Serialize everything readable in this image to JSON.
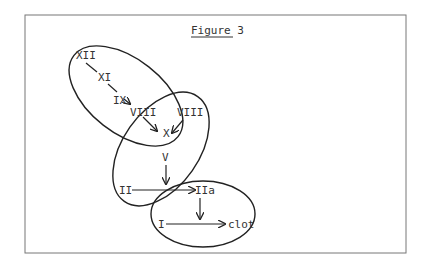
{
  "figure": {
    "title": "Figure 3",
    "nodes": {
      "xii": "XII",
      "xi": "XI",
      "ix": "IX",
      "viii_a": "VIII",
      "viii_b": "VIII",
      "x": "X",
      "v": "V",
      "ii": "II",
      "iia": "IIa",
      "i": "I",
      "clot": "clot"
    },
    "edges": [
      {
        "from": "XII",
        "to": "XI"
      },
      {
        "from": "XI",
        "to": "IX"
      },
      {
        "from": "IX",
        "to": "VIII"
      },
      {
        "from": "VIII",
        "to": "X"
      },
      {
        "from": "VIII",
        "to": "X"
      },
      {
        "from": "V",
        "to": "II→IIa"
      },
      {
        "from": "II",
        "to": "IIa"
      },
      {
        "from": "IIa",
        "to": "I→clot"
      },
      {
        "from": "I",
        "to": "clot"
      }
    ],
    "groups": [
      "intrinsic-pathway",
      "common-pathway",
      "fibrin-formation"
    ]
  }
}
